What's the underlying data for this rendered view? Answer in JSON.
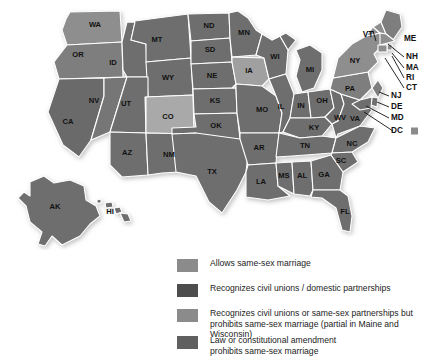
{
  "figure": {
    "kind": "choropleth-map"
  },
  "colors": {
    "allows": "#8b8b8b",
    "civil_unions": "#4d4d4d",
    "civil_unions_prohibits": "#7d7d7d",
    "prohibits": "#606060",
    "light_gray": "#b4b4b4",
    "border": "#ffffff",
    "background": "#ffffff",
    "text": "#1a1a1a"
  },
  "legend": {
    "items": [
      {
        "id": "allows",
        "swatch": "#8b8b8b",
        "label": "Allows same-sex marriage"
      },
      {
        "id": "civil-unions",
        "swatch": "#4d4d4d",
        "label": "Recognizes civil unions / domestic partnerships"
      },
      {
        "id": "civil-unions-prohibits-marriage",
        "swatch": "#8b8b8b",
        "label": "Recognizes civil unions or same-sex partnerships but\nprohibits same-sex marriage (partial in Maine and Wisconsin)"
      },
      {
        "id": "prohibits",
        "swatch": "#606060",
        "label": "Law or constitutional amendment\nprohibits same-sex marriage"
      }
    ]
  },
  "map": {
    "dc_marker_label": "DC",
    "states": [
      {
        "abbr": "WA",
        "fill": "#8e8e8e",
        "lx": 95,
        "ly": 25
      },
      {
        "abbr": "OR",
        "fill": "#7e7e7e",
        "lx": 78,
        "ly": 54
      },
      {
        "abbr": "CA",
        "fill": "#6b6b6b",
        "lx": 70,
        "ly": 123
      },
      {
        "abbr": "NV",
        "fill": "#767676",
        "lx": 92,
        "ly": 100
      },
      {
        "abbr": "ID",
        "fill": "#6e6e6e",
        "lx": 113,
        "ly": 63
      },
      {
        "abbr": "MT",
        "fill": "#6e6e6e",
        "lx": 155,
        "ly": 42
      },
      {
        "abbr": "WY",
        "fill": "#6e6e6e",
        "lx": 140,
        "ly": 80
      },
      {
        "abbr": "UT",
        "fill": "#6e6e6e",
        "lx": 119,
        "ly": 105
      },
      {
        "abbr": "CO",
        "fill": "#a9a9a9",
        "lx": 165,
        "ly": 119
      },
      {
        "abbr": "AZ",
        "fill": "#6e6e6e",
        "lx": 96,
        "ly": 152
      },
      {
        "abbr": "NM",
        "fill": "#6e6e6e",
        "lx": 141,
        "ly": 158
      },
      {
        "abbr": "ND",
        "fill": "#6e6e6e",
        "lx": 207,
        "ly": 44
      },
      {
        "abbr": "SD",
        "fill": "#6e6e6e",
        "lx": 209,
        "ly": 70
      },
      {
        "abbr": "NE",
        "fill": "#6e6e6e",
        "lx": 211,
        "ly": 97
      },
      {
        "abbr": "KS",
        "fill": "#6e6e6e",
        "lx": 216,
        "ly": 125
      },
      {
        "abbr": "OK",
        "fill": "#6e6e6e",
        "lx": 222,
        "ly": 150
      },
      {
        "abbr": "TX",
        "fill": "#6e6e6e",
        "lx": 213,
        "ly": 186
      },
      {
        "abbr": "MN",
        "fill": "#6e6e6e",
        "lx": 243,
        "ly": 47
      },
      {
        "abbr": "IA",
        "fill": "#a0a0a0",
        "lx": 247,
        "ly": 92
      },
      {
        "abbr": "MO",
        "fill": "#6e6e6e",
        "lx": 263,
        "ly": 124
      },
      {
        "abbr": "AR",
        "fill": "#6e6e6e",
        "lx": 258,
        "ly": 157
      },
      {
        "abbr": "LA",
        "fill": "#6e6e6e",
        "lx": 263,
        "ly": 186
      },
      {
        "abbr": "WI",
        "fill": "#6e6e6e",
        "lx": 274,
        "ly": 64
      },
      {
        "abbr": "IL",
        "fill": "#6e6e6e",
        "lx": 281,
        "ly": 108
      },
      {
        "abbr": "MS",
        "fill": "#6e6e6e",
        "lx": 281,
        "ly": 176
      },
      {
        "abbr": "AL",
        "fill": "#6e6e6e",
        "lx": 299,
        "ly": 175
      },
      {
        "abbr": "MI",
        "fill": "#6e6e6e",
        "lx": 309,
        "ly": 73
      },
      {
        "abbr": "IN",
        "fill": "#6e6e6e",
        "lx": 300,
        "ly": 106
      },
      {
        "abbr": "OH",
        "fill": "#6e6e6e",
        "lx": 320,
        "ly": 101
      },
      {
        "abbr": "KY",
        "fill": "#6e6e6e",
        "lx": 313,
        "ly": 127
      },
      {
        "abbr": "TN",
        "fill": "#6e6e6e",
        "lx": 303,
        "ly": 146
      },
      {
        "abbr": "GA",
        "fill": "#6e6e6e",
        "lx": 322,
        "ly": 175
      },
      {
        "abbr": "FL",
        "fill": "#6e6e6e",
        "lx": 344,
        "ly": 212
      },
      {
        "abbr": "SC",
        "fill": "#6e6e6e",
        "lx": 340,
        "ly": 161
      },
      {
        "abbr": "NC",
        "fill": "#6e6e6e",
        "lx": 348,
        "ly": 144
      },
      {
        "abbr": "WV",
        "fill": "#6e6e6e",
        "lx": 334,
        "ly": 115
      },
      {
        "abbr": "VA",
        "fill": "#6e6e6e",
        "lx": 349,
        "ly": 124
      },
      {
        "abbr": "PA",
        "fill": "#7e7e7e",
        "lx": 348,
        "ly": 91
      },
      {
        "abbr": "NY",
        "fill": "#8e8e8e",
        "lx": 357,
        "ly": 63
      },
      {
        "abbr": "AK",
        "fill": "#6e6e6e",
        "lx": 52,
        "ly": 206
      },
      {
        "abbr": "HI",
        "fill": "#6e6e6e",
        "lx": 106,
        "ly": 211
      }
    ],
    "callout_labels": [
      {
        "abbr": "VT",
        "x": 374,
        "y": 35
      },
      {
        "abbr": "ME",
        "x": 408,
        "y": 39
      },
      {
        "abbr": "NH",
        "x": 416,
        "y": 57
      },
      {
        "abbr": "MA",
        "x": 416,
        "y": 68
      },
      {
        "abbr": "RI",
        "x": 416,
        "y": 78
      },
      {
        "abbr": "CT",
        "x": 416,
        "y": 88
      },
      {
        "abbr": "NJ",
        "x": 393,
        "y": 96
      },
      {
        "abbr": "DE",
        "x": 393,
        "y": 107
      },
      {
        "abbr": "MD",
        "x": 393,
        "y": 118
      },
      {
        "abbr": "DC",
        "x": 397,
        "y": 131
      }
    ]
  }
}
